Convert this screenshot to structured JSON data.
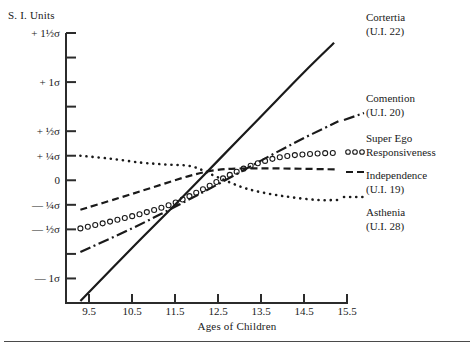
{
  "chart_data": {
    "type": "line",
    "title": "",
    "xlabel": "Ages of Children",
    "ylabel": "S. I. Units",
    "xlim": [
      9.25,
      15.5
    ],
    "ylim": [
      -1.25,
      1.5
    ],
    "grid": false,
    "legend_position": "right-outside",
    "xticks": [
      9.5,
      10.5,
      11.5,
      12.5,
      13.5,
      14.5,
      15.5
    ],
    "xtick_labels": [
      "9.5",
      "10.5",
      "11.5",
      "12.5",
      "13.5",
      "14.5",
      "15.5"
    ],
    "yticks": [
      1.5,
      1.25,
      1.0,
      0.75,
      0.5,
      0.25,
      0,
      -0.25,
      -0.5,
      -0.75,
      -1.0,
      -1.25
    ],
    "ytick_labels": [
      "+ 1½σ",
      "",
      "+ 1σ",
      "",
      "+ ½σ",
      "+ ¼σ",
      "0",
      "— ¼σ",
      "— ½σ",
      "",
      "— 1σ",
      ""
    ],
    "series": [
      {
        "name": "Cortertia",
        "code": "(U.I. 22)",
        "label": "Cortertia\n(U.I. 22)",
        "style": "solid",
        "x": [
          9.3,
          10.5,
          11.5,
          12.5,
          13.5,
          14.5,
          15.2
        ],
        "y": [
          -1.23,
          -0.69,
          -0.25,
          0.2,
          0.65,
          1.1,
          1.4
        ]
      },
      {
        "name": "Comention",
        "code": "(U.I. 20)",
        "label": "Comention\n(U.I. 20)",
        "style": "dash-dot",
        "x": [
          9.3,
          10.5,
          11.5,
          12.5,
          13.5,
          14.5,
          15.3
        ],
        "y": [
          -0.73,
          -0.49,
          -0.27,
          -0.04,
          0.2,
          0.43,
          0.6
        ]
      },
      {
        "name": "Super Ego Responsiveness",
        "code": "",
        "label": "Super Ego\nResponsiveness",
        "style": "open-circles",
        "x": [
          9.3,
          10.0,
          10.8,
          11.5,
          12.2,
          12.8,
          13.4,
          14.0,
          14.7,
          15.3
        ],
        "y": [
          -0.49,
          -0.42,
          -0.33,
          -0.23,
          -0.08,
          0.06,
          0.17,
          0.24,
          0.27,
          0.28
        ]
      },
      {
        "name": "Independence",
        "code": "(U.I. 19)",
        "label": "Independence\n(U.I. 19)",
        "style": "dashed",
        "x": [
          9.3,
          10.2,
          11.0,
          11.8,
          12.4,
          13.0,
          14.0,
          15.3
        ],
        "y": [
          -0.3,
          -0.18,
          -0.07,
          0.04,
          0.1,
          0.12,
          0.12,
          0.11
        ]
      },
      {
        "name": "Asthenia",
        "code": "(U.I. 28)",
        "label": "Asthenia\n(U.I. 28)",
        "style": "dotted",
        "x": [
          9.3,
          10.0,
          10.7,
          11.3,
          11.9,
          12.5,
          13.2,
          14.0,
          14.8,
          15.3
        ],
        "y": [
          0.25,
          0.22,
          0.18,
          0.16,
          0.14,
          0.03,
          -0.09,
          -0.16,
          -0.2,
          -0.2
        ]
      }
    ]
  },
  "legend": {
    "cortertia": {
      "line1": "Cortertia",
      "line2": "(U.I. 22)"
    },
    "comention": {
      "line1": "Comention",
      "line2": "(U.I. 20)"
    },
    "superego": {
      "line1": "Super Ego",
      "line2": "Responsiveness"
    },
    "independence": {
      "line1": "Independence",
      "line2": "(U.I. 19)"
    },
    "asthenia": {
      "line1": "Asthenia",
      "line2": "(U.I. 28)"
    }
  },
  "colors": {
    "ink": "#1a1a1a",
    "axis": "#2b2b2b",
    "rule": "#4a4a4a"
  }
}
